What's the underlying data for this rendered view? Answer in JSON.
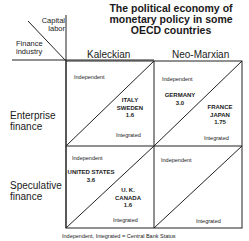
{
  "title": [
    "The political economy of",
    "monetary policy in some",
    "OECD countries"
  ],
  "corner": {
    "top_label": [
      "Capital",
      "labor"
    ],
    "bottom_label": [
      "Finance",
      "industry"
    ]
  },
  "columns": [
    "Kaleckian",
    "Neo-Marxian"
  ],
  "rows": [
    {
      "label": [
        "Enterprise",
        "finance"
      ]
    },
    {
      "label": [
        "Speculative",
        "finance"
      ]
    }
  ],
  "cell_labels": {
    "upper": "Independent",
    "lower": "Integrated"
  },
  "cells": {
    "enterprise_kaleckian": {
      "countries": [
        "ITALY",
        "SWEDEN",
        "1.6"
      ],
      "side": "integrated"
    },
    "enterprise_neomarxian_independent": {
      "countries": [
        "GERMANY",
        "3.0"
      ]
    },
    "enterprise_neomarxian_integrated": {
      "countries": [
        "FRANCE",
        "JAPAN",
        "1.75"
      ]
    },
    "speculative_kaleckian_independent": {
      "countries": [
        "UNITED STATES",
        "3.6"
      ]
    },
    "speculative_kaleckian_integrated": {
      "countries": [
        "U. K.",
        "CANADA",
        "1.6"
      ]
    },
    "speculative_neomarxian": {
      "countries": []
    }
  },
  "footer": "Independent, Integrated = Central Bank Status"
}
